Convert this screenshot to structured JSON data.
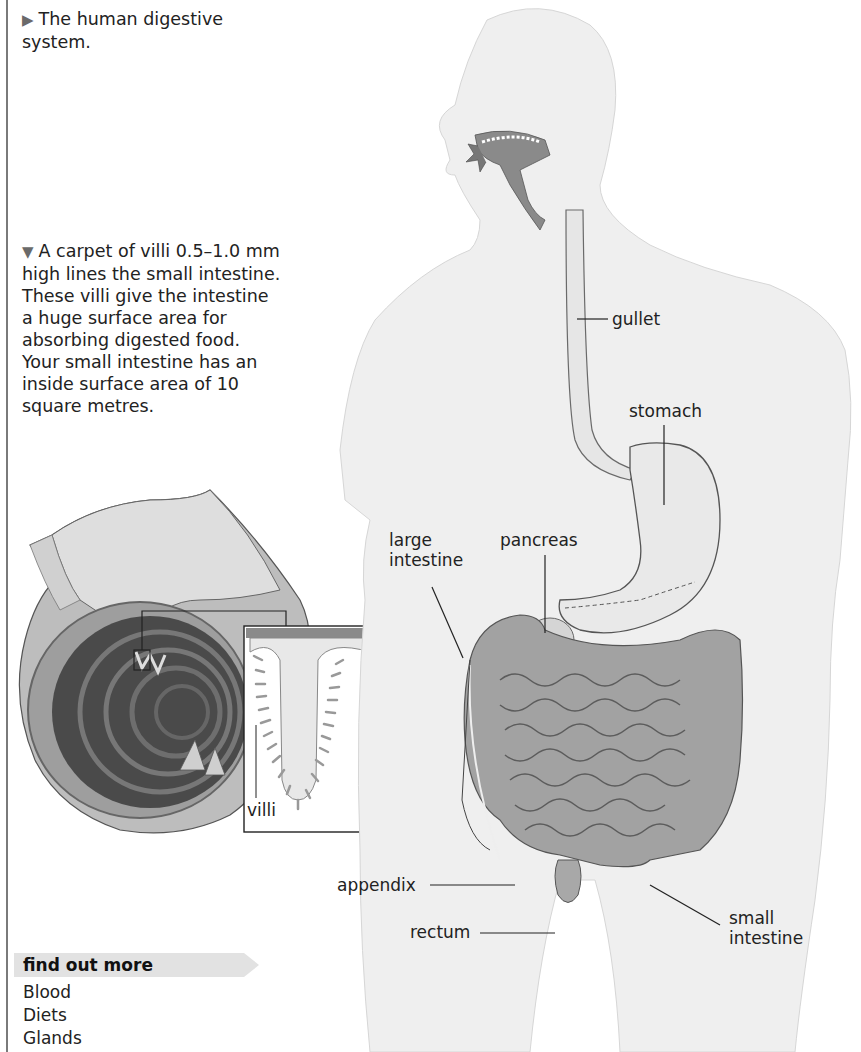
{
  "captions": {
    "main_figure": {
      "marker": "▶",
      "text": "The human digestive system."
    },
    "villi_figure": {
      "marker": "▼",
      "text": "A carpet of villi 0.5–1.0 mm high lines the small intestine. These villi give the intestine a huge surface area for absorbing digested food. Your small intestine has an inside surface area of 10 square metres."
    }
  },
  "villi_inset": {
    "label": "villi"
  },
  "body_labels": {
    "gullet": "gullet",
    "stomach": "stomach",
    "large_intestine_line1": "large",
    "large_intestine_line2": "intestine",
    "pancreas": "pancreas",
    "appendix": "appendix",
    "rectum": "rectum",
    "small_intestine_line1": "small",
    "small_intestine_line2": "intestine"
  },
  "find_out_more": {
    "title": "find out more",
    "links": [
      "Blood",
      "Diets",
      "Glands"
    ]
  },
  "colors": {
    "rule": "#7a7a7a",
    "fom_banner": "#e2e2e2",
    "body_fill": "#efefef",
    "organ_fill": "#d9d9d9",
    "intestine_fill": "#9a9a9a"
  }
}
